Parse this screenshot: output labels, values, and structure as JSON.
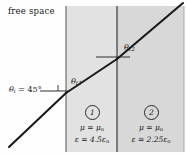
{
  "figure": {
    "width": 187,
    "height": 156,
    "background": "#fefefe"
  },
  "labels": {
    "free_space": "free space",
    "theta_i": "θ",
    "theta_i_sub": "i",
    "theta_i_value": " = 45°",
    "theta_t1": "θ",
    "theta_t1_sub": "t1",
    "theta_t2": "θ",
    "theta_t2_sub": "t2"
  },
  "regions": [
    {
      "number": "1",
      "mu_symbol": "μ",
      "mu_value": " = μ",
      "mu_sub": "o",
      "eps_symbol": "ε",
      "eps_value": " = 4.5ε",
      "eps_sub": "o",
      "fill": "#e2e2e2",
      "x_start": 66,
      "x_end": 117
    },
    {
      "number": "2",
      "mu_symbol": "μ",
      "mu_value": " = μ",
      "mu_sub": "o",
      "eps_symbol": "ε",
      "eps_value": " = 2.25ε",
      "eps_sub": "o",
      "fill": "#d8d8d8",
      "x_start": 117,
      "x_end": 184
    }
  ],
  "geometry": {
    "ray_color": "#1a1a1a",
    "boundary_color": "#3a3a3a",
    "incident_start_x": 9,
    "incident_start_y": 147,
    "interface1_x": 66,
    "interface1_y": 93,
    "interface2_x": 117,
    "interface2_y": 59,
    "exit_x": 183,
    "exit_y": 3,
    "normal1_x_start": 40,
    "normal1_y": 91,
    "normal2_x_start": 96,
    "normal2_y": 57,
    "normal2_x_end": 130,
    "slab_top": 6,
    "slab_bottom": 152
  },
  "colors": {
    "region1_fill": "#e2e2e2",
    "region2_fill": "#d8d8d8",
    "line": "#1a1a1a",
    "text": "#1a1a1a"
  }
}
